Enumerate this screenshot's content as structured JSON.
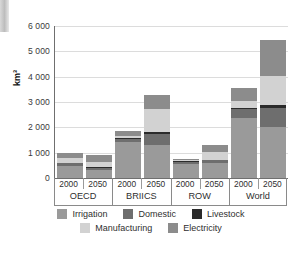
{
  "chart_data": {
    "type": "bar",
    "title": "",
    "subtitle": "",
    "xlabel": "",
    "ylabel": "km³",
    "ylim": [
      0,
      6000
    ],
    "yticks": [
      0,
      1000,
      2000,
      3000,
      4000,
      5000,
      6000
    ],
    "ytick_labels": [
      "0",
      "1 000",
      "2 000",
      "3 000",
      "4 000",
      "5 000",
      "6 000"
    ],
    "grid": true,
    "stacked": true,
    "legend_position": "bottom",
    "groups": [
      "OECD",
      "BRIICS",
      "ROW",
      "World"
    ],
    "years": [
      "2000",
      "2050"
    ],
    "categories": [
      "OECD 2000",
      "OECD 2050",
      "BRIICS 2000",
      "BRIICS 2050",
      "ROW 2000",
      "ROW 2050",
      "World 2000",
      "World 2050"
    ],
    "series": [
      {
        "name": "Irrigation",
        "color": "#9a9a9a",
        "values": [
          480,
          300,
          1440,
          1300,
          570,
          590,
          2380,
          2010
        ]
      },
      {
        "name": "Domestic",
        "color": "#6e6e6e",
        "values": [
          110,
          110,
          100,
          450,
          70,
          110,
          330,
          760
        ]
      },
      {
        "name": "Livestock",
        "color": "#2b2b2b",
        "values": [
          20,
          20,
          30,
          60,
          20,
          30,
          60,
          100
        ]
      },
      {
        "name": "Manufacturing",
        "color": "#d2d2d2",
        "values": [
          170,
          190,
          80,
          930,
          40,
          280,
          290,
          1140
        ]
      },
      {
        "name": "Electricity",
        "color": "#8c8c8c",
        "values": [
          220,
          280,
          200,
          540,
          60,
          310,
          490,
          1440
        ]
      }
    ],
    "totals": [
      1000,
      900,
      1850,
      3280,
      760,
      1320,
      3550,
      5450
    ]
  },
  "legend": {
    "row1": [
      {
        "label": "Irrigation",
        "swatch_name": "legend-swatch-irrigation"
      },
      {
        "label": "Domestic",
        "swatch_name": "legend-swatch-domestic"
      },
      {
        "label": "Livestock",
        "swatch_name": "legend-swatch-livestock"
      }
    ],
    "row2": [
      {
        "label": "Manufacturing",
        "swatch_name": "legend-swatch-manufacturing"
      },
      {
        "label": "Electricity",
        "swatch_name": "legend-swatch-electricity"
      }
    ]
  },
  "colors": {
    "irrigation": "#9a9a9a",
    "domestic": "#6e6e6e",
    "livestock": "#2b2b2b",
    "manufacturing": "#d2d2d2",
    "electricity": "#8c8c8c",
    "grid": "#dcdcdc",
    "axis": "#6f6f6f",
    "text": "#2f2f2f",
    "background": "#ffffff"
  }
}
